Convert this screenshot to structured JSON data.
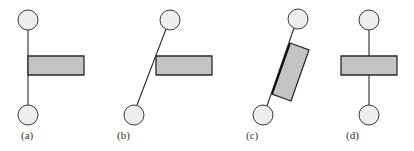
{
  "figure": {
    "panels": [
      {
        "id": "a",
        "label": "(a)",
        "description": "vertical rod, plate attached on right side",
        "label_pos": [
          21,
          139
        ],
        "top_ball": {
          "cx": 28,
          "cy": 20,
          "r": 10
        },
        "bottom_ball": {
          "cx": 28,
          "cy": 115,
          "r": 10
        },
        "rod": {
          "x1": 28,
          "y1": 30,
          "x2": 28,
          "y2": 105
        },
        "plate": {
          "points": "28,56 84,56 84,75 28,75"
        }
      },
      {
        "id": "b",
        "label": "(b)",
        "description": "tilted rod, horizontal plate touching rod at left edge",
        "label_pos": [
          117,
          139
        ],
        "top_ball": {
          "cx": 170,
          "cy": 20,
          "r": 10
        },
        "bottom_ball": {
          "cx": 134,
          "cy": 115,
          "r": 10
        },
        "rod": {
          "x1": 166,
          "y1": 29,
          "x2": 137,
          "y2": 105
        },
        "plate": {
          "points": "156,56 212,56 212,75 156,75"
        }
      },
      {
        "id": "c",
        "label": "(c)",
        "description": "tilted rod, plate rotated to align with rod",
        "label_pos": [
          246,
          139
        ],
        "top_ball": {
          "cx": 298,
          "cy": 19,
          "r": 10
        },
        "bottom_ball": {
          "cx": 263,
          "cy": 115,
          "r": 10
        },
        "rod": {
          "x1": 294,
          "y1": 28,
          "x2": 267,
          "y2": 106
        },
        "plate": {
          "points": "290,43 309,50 291,101 272,94"
        },
        "plate_edge": {
          "x1": 290,
          "y1": 43,
          "x2": 272,
          "y2": 94
        }
      },
      {
        "id": "d",
        "label": "(d)",
        "description": "vertical rod, plate centered on rod",
        "label_pos": [
          346,
          139
        ],
        "top_ball": {
          "cx": 369,
          "cy": 20,
          "r": 10
        },
        "bottom_ball": {
          "cx": 369,
          "cy": 115,
          "r": 10
        },
        "rod": {
          "x1": 369,
          "y1": 30,
          "x2": 369,
          "y2": 105
        },
        "plate": {
          "points": "341,56 397,56 397,75 341,75"
        }
      }
    ],
    "colors": {
      "plate_fill": "#c4c4c4",
      "ball_fill": "#eeeeee",
      "stroke": "#2a2a2a"
    }
  }
}
